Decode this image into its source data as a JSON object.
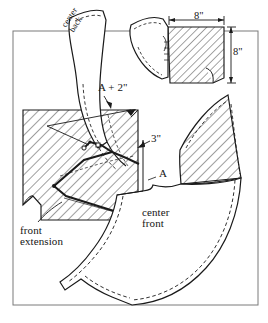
{
  "figure": {
    "background_color": "#ffffff",
    "ink_color": "#1a1a1a",
    "hatch_color": "#2a2a2a",
    "frame": {
      "name": "fabric-yardage-frame",
      "x": 13,
      "y": 31,
      "width": 245,
      "height": 274,
      "stroke": "#6b6b6b"
    }
  },
  "labels": {
    "center_back": "center\nback",
    "center_back_line1": "center",
    "center_back_line2": "back",
    "a_plus_2": "A + 2\"",
    "three_inches": "3\"",
    "a": "A",
    "center_front_line1": "center",
    "center_front_line2": "front",
    "front_extension_line1": "front",
    "front_extension_line2": "extension",
    "eight_inches_horizontal": "8\"",
    "eight_inches_vertical": "8\""
  },
  "dimensions": [
    {
      "name": "top-square-width",
      "value": "8\"",
      "orientation": "horizontal"
    },
    {
      "name": "top-square-height",
      "value": "8\"",
      "orientation": "vertical"
    },
    {
      "name": "front-extension-height",
      "value": "A",
      "orientation": "vertical"
    },
    {
      "name": "upper-span",
      "value": "A + 2\"",
      "orientation": "leader"
    },
    {
      "name": "dart-depth",
      "value": "3\"",
      "orientation": "leader"
    }
  ],
  "pieces": [
    {
      "name": "center-back-flounce",
      "label": "center back",
      "style": "curved-plain"
    },
    {
      "name": "top-small-flounce",
      "label": "",
      "style": "curved-plain"
    },
    {
      "name": "top-hatched-square",
      "label": "",
      "style": "hatched"
    },
    {
      "name": "main-hatched-rectangle",
      "label": "",
      "style": "hatched"
    },
    {
      "name": "right-hatched-wedge",
      "label": "",
      "style": "hatched"
    },
    {
      "name": "large-crescent-flounce",
      "label": "",
      "style": "curved-plain"
    }
  ],
  "caption": {
    "partial_text": ""
  }
}
